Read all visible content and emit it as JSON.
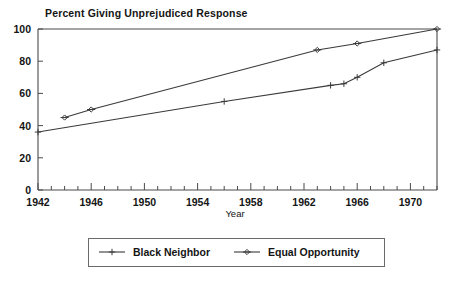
{
  "chart_data": {
    "type": "line",
    "title": "Percent Giving Unprejudiced Response",
    "xlabel": "Year",
    "ylabel": "",
    "xlim": [
      1942,
      1972
    ],
    "ylim": [
      0,
      100
    ],
    "grid": false,
    "legend_position": "bottom",
    "x_ticks": [
      1942,
      1946,
      1950,
      1954,
      1958,
      1962,
      1966,
      1970
    ],
    "x_tick_labels": [
      "1942",
      "1946",
      "1950",
      "1954",
      "1958",
      "1962",
      "1966",
      "1970"
    ],
    "x_minor_tick_step": 1,
    "y_ticks": [
      0,
      20,
      40,
      60,
      80,
      100
    ],
    "y_tick_labels": [
      "0",
      "20",
      "40",
      "60",
      "80",
      "100"
    ],
    "series": [
      {
        "name": "Black Neighbor",
        "marker": "plus",
        "x": [
          1942,
          1956,
          1964,
          1965,
          1966,
          1968,
          1972
        ],
        "values": [
          36,
          55,
          65,
          66,
          70,
          79,
          87
        ]
      },
      {
        "name": "Equal Opportunity",
        "marker": "diamond",
        "x": [
          1944,
          1946,
          1963,
          1966,
          1972
        ],
        "values": [
          45,
          50,
          87,
          91,
          100
        ]
      }
    ]
  },
  "legend": {
    "items": [
      {
        "label": "Black Neighbor",
        "marker": "plus"
      },
      {
        "label": "Equal Opportunity",
        "marker": "diamond"
      }
    ]
  },
  "colors": {
    "line": "#3a3a3a",
    "axis": "#4a4a4a",
    "text": "#151515",
    "background": "#ffffff",
    "legend_border": "#6a6a6a"
  }
}
